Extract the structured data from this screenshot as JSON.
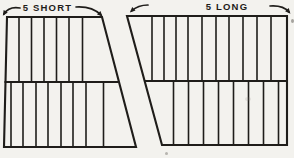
{
  "meta": {
    "paper_color": "#f3f2ee",
    "ink_color": "#1f1d1a"
  },
  "diagram": {
    "panels": [
      {
        "id": "short",
        "label": "5 SHORT",
        "label_pos": {
          "x": 47.5,
          "y": 11
        },
        "outline": [
          [
            7,
            17
          ],
          [
            102,
            17
          ],
          [
            136,
            147
          ],
          [
            4,
            147
          ]
        ],
        "top_y": 17,
        "mid_y": 82,
        "bottom_y": 147,
        "midline": {
          "x1": 4.5,
          "x2": 118.5
        },
        "top_stripe_xs": [
          19,
          31.5,
          44,
          56.5,
          69,
          82.5
        ],
        "bottom_stripe_xs": [
          11,
          23,
          36,
          48,
          61,
          73,
          86,
          103.5
        ],
        "arrows": [
          {
            "name": "short-span-left-arrow",
            "tail": [
              20,
              8
            ],
            "ctrl": [
              9,
              6
            ],
            "head": [
              4,
              14
            ]
          },
          {
            "name": "short-span-right-arrow",
            "tail": [
              76,
              7
            ],
            "ctrl": [
              92,
              6
            ],
            "head": [
              101,
              15
            ]
          }
        ]
      },
      {
        "id": "long",
        "label": "5 LONG",
        "label_pos": {
          "x": 227,
          "y": 10
        },
        "outline": [
          [
            127,
            16
          ],
          [
            287,
            16
          ],
          [
            287,
            145
          ],
          [
            162,
            145
          ]
        ],
        "top_y": 16,
        "mid_y": 81,
        "bottom_y": 145,
        "midline": {
          "x1": 144.5,
          "x2": 287
        },
        "top_stripe_xs": [
          152,
          164,
          176,
          188,
          202,
          216,
          229,
          243,
          257,
          271
        ],
        "bottom_stripe_xs": [
          173.5,
          188.5,
          203.5,
          218.5,
          233.5,
          248.5,
          263.5,
          278.5
        ],
        "arrows": [
          {
            "name": "long-span-left-arrow",
            "tail": [
              148,
              5
            ],
            "ctrl": [
              138,
              5
            ],
            "head": [
              131.5,
              11
            ]
          },
          {
            "name": "long-span-right-arrow",
            "tail": [
              270,
              6
            ],
            "ctrl": [
              283,
              5
            ],
            "head": [
              289,
              12
            ]
          }
        ]
      }
    ]
  }
}
